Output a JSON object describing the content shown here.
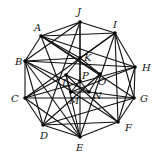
{
  "diagram": {
    "type": "graph",
    "colors": {
      "edge": "#111111",
      "vertex": "#000000",
      "background": "#ffffff"
    },
    "vertices": [
      {
        "id": "A",
        "x": 41,
        "y": 36,
        "lx": 34,
        "ly": 31
      },
      {
        "id": "B",
        "x": 25,
        "y": 61,
        "lx": 15,
        "ly": 65
      },
      {
        "id": "C",
        "x": 25,
        "y": 98,
        "lx": 11,
        "ly": 102
      },
      {
        "id": "D",
        "x": 43,
        "y": 125,
        "lx": 40,
        "ly": 139
      },
      {
        "id": "E",
        "x": 80,
        "y": 137,
        "lx": 76,
        "ly": 151
      },
      {
        "id": "F",
        "x": 118,
        "y": 122,
        "lx": 125,
        "ly": 131
      },
      {
        "id": "G",
        "x": 134,
        "y": 98,
        "lx": 140,
        "ly": 102
      },
      {
        "id": "H",
        "x": 135,
        "y": 67,
        "lx": 142,
        "ly": 71
      },
      {
        "id": "I",
        "x": 115,
        "y": 33,
        "lx": 113,
        "ly": 28
      },
      {
        "id": "J",
        "x": 80,
        "y": 22,
        "lx": 77,
        "ly": 15
      },
      {
        "id": "K",
        "x": 80,
        "y": 58,
        "lx": 84,
        "ly": 61
      },
      {
        "id": "L",
        "x": 66,
        "y": 75,
        "lx": 62,
        "ly": 86
      },
      {
        "id": "M",
        "x": 71,
        "y": 92,
        "lx": 69,
        "ly": 104
      },
      {
        "id": "N",
        "x": 89,
        "y": 92,
        "lx": 93,
        "ly": 99
      },
      {
        "id": "O",
        "x": 100,
        "y": 74,
        "lx": 98,
        "ly": 85
      },
      {
        "id": "P",
        "x": 80,
        "y": 81,
        "lx": 82,
        "ly": 79
      }
    ],
    "edges": [
      [
        "A",
        "J"
      ],
      [
        "J",
        "I"
      ],
      [
        "I",
        "H"
      ],
      [
        "H",
        "G"
      ],
      [
        "G",
        "F"
      ],
      [
        "F",
        "E"
      ],
      [
        "E",
        "D"
      ],
      [
        "D",
        "C"
      ],
      [
        "C",
        "B"
      ],
      [
        "B",
        "A"
      ],
      [
        "A",
        "K"
      ],
      [
        "A",
        "H"
      ],
      [
        "A",
        "O"
      ],
      [
        "A",
        "E"
      ],
      [
        "A",
        "G"
      ],
      [
        "B",
        "J"
      ],
      [
        "B",
        "K"
      ],
      [
        "B",
        "N"
      ],
      [
        "B",
        "E"
      ],
      [
        "B",
        "H"
      ],
      [
        "C",
        "L"
      ],
      [
        "C",
        "G"
      ],
      [
        "C",
        "H"
      ],
      [
        "C",
        "I"
      ],
      [
        "C",
        "E"
      ],
      [
        "D",
        "J"
      ],
      [
        "D",
        "F"
      ],
      [
        "D",
        "O"
      ],
      [
        "D",
        "G"
      ],
      [
        "D",
        "B"
      ],
      [
        "E",
        "J"
      ],
      [
        "E",
        "I"
      ],
      [
        "E",
        "L"
      ],
      [
        "F",
        "L"
      ],
      [
        "F",
        "B"
      ],
      [
        "F",
        "I"
      ],
      [
        "F",
        "H"
      ],
      [
        "G",
        "N"
      ],
      [
        "G",
        "I"
      ],
      [
        "H",
        "M"
      ],
      [
        "I",
        "A"
      ],
      [
        "I",
        "K"
      ],
      [
        "J",
        "P"
      ],
      [
        "K",
        "L"
      ],
      [
        "K",
        "O"
      ],
      [
        "L",
        "M"
      ],
      [
        "L",
        "P"
      ],
      [
        "M",
        "N"
      ],
      [
        "M",
        "P"
      ],
      [
        "N",
        "O"
      ],
      [
        "N",
        "P"
      ]
    ]
  }
}
